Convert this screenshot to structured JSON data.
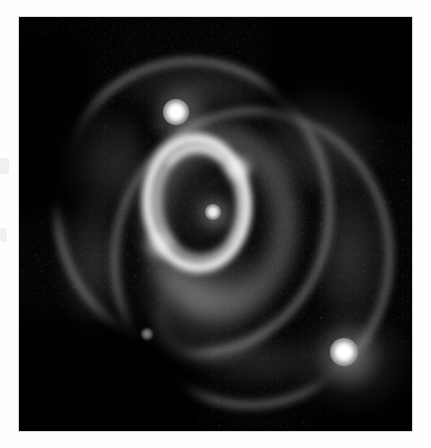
{
  "figure": {
    "kind": "astronomical-image",
    "object_name": "SN 1987A triple-ring nebula",
    "frame": {
      "left": 19,
      "top": 17,
      "width": 393,
      "height": 414,
      "background_color": "#000000",
      "page_background_color": "#fefefe",
      "border_color": "#d9d9d9"
    },
    "palette": {
      "sky": "#000000",
      "faint_nebulosity": "#6e6e6e",
      "bright_ring": "#eeeeee",
      "star_core": "#ffffff",
      "page": "#fefefe"
    }
  },
  "chart_data": {
    "type": "scatter",
    "title": "",
    "xlabel": "",
    "ylabel": "",
    "grid": false,
    "legend": null,
    "colorscale": "grayscale",
    "xlim": [
      0,
      393
    ],
    "ylim": [
      0,
      414
    ],
    "features": [
      {
        "name": "inner-equatorial-ring",
        "shape": "ellipse-annulus",
        "cx": 178,
        "cy": 186,
        "rx": 55,
        "ry": 70,
        "thickness": 11,
        "rotation_deg": -4,
        "brightness": 0.92
      },
      {
        "name": "outer-ring-north",
        "shape": "ellipse-annulus",
        "cx": 174,
        "cy": 190,
        "rx": 140,
        "ry": 150,
        "thickness": 7,
        "rotation_deg": -7,
        "brightness": 0.42
      },
      {
        "name": "outer-ring-south",
        "shape": "ellipse-annulus",
        "cx": 233,
        "cy": 241,
        "rx": 141,
        "ry": 151,
        "thickness": 7,
        "rotation_deg": 7,
        "brightness": 0.4
      },
      {
        "name": "southern-diffuse-lobe",
        "shape": "arc",
        "cx": 195,
        "cy": 295,
        "rx": 65,
        "ry": 55,
        "brightness": 0.35
      }
    ],
    "point_sources": [
      {
        "name": "star-2",
        "x": 157,
        "y": 95,
        "radius": 13,
        "brightness": 1.0
      },
      {
        "name": "star-3",
        "x": 325,
        "y": 335,
        "radius": 14,
        "brightness": 1.0
      },
      {
        "name": "central-source",
        "x": 194,
        "y": 195,
        "radius": 8,
        "brightness": 0.82
      },
      {
        "name": "faint-field-star",
        "x": 128,
        "y": 317,
        "radius": 6,
        "brightness": 0.45
      }
    ]
  }
}
